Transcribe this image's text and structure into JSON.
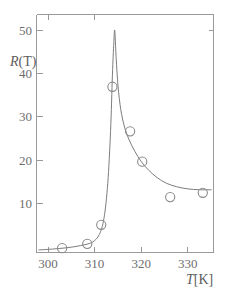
{
  "chart_data": {
    "type": "line",
    "title": "",
    "subtitle": "",
    "xlabel": "T[K]",
    "ylabel": "R(T)",
    "xlim": [
      297.5,
      335.5
    ],
    "ylim": [
      0,
      55
    ],
    "xticks": [
      300,
      310,
      320,
      330
    ],
    "yticks": [
      10,
      20,
      30,
      40,
      50
    ],
    "xtick_labels": [
      "300",
      "310",
      "320",
      "330"
    ],
    "ytick_labels": [
      "10",
      "20",
      "30",
      "40",
      "50"
    ],
    "grid": false,
    "legend": "none",
    "marker": "open-circle",
    "series": [
      {
        "name": "measured",
        "type": "scatter",
        "marker": "open-circle",
        "x": [
          303.0,
          308.4,
          311.4,
          313.8,
          317.6,
          320.2,
          326.2,
          333.2
        ],
        "y": [
          1.0,
          2.0,
          6.4,
          38.3,
          28.0,
          21.0,
          12.8,
          13.8
        ]
      },
      {
        "name": "fit",
        "type": "line",
        "x": [
          298.0,
          301.0,
          304.0,
          307.0,
          309.5,
          311.0,
          312.0,
          312.8,
          313.4,
          313.8,
          314.1,
          314.3,
          314.6,
          315.0,
          315.6,
          316.4,
          317.4,
          318.6,
          320.0,
          321.6,
          323.4,
          325.4,
          327.6,
          330.0,
          332.5,
          335.0
        ],
        "y": [
          0.6,
          0.8,
          1.1,
          1.6,
          2.4,
          4.2,
          8.0,
          16.0,
          28.0,
          41.0,
          48.5,
          51.3,
          45.0,
          38.5,
          33.0,
          29.0,
          26.0,
          23.4,
          21.0,
          19.0,
          17.3,
          16.0,
          15.2,
          14.7,
          14.5,
          14.5
        ]
      }
    ],
    "peak": {
      "x": 314.3,
      "y": 51.3
    },
    "axis_title_x": "T[K]",
    "axis_title_y": "R(T)",
    "colors": {
      "axis": "#9a9a9a",
      "curve": "#7d7d7d",
      "marker": "#8a8a8a",
      "text": "#6e6e6e",
      "background": "#ffffff"
    }
  },
  "labels": {
    "y_axis_title_symbol": "R",
    "y_axis_title_arg": "(T)",
    "x_axis_title_symbol": "T",
    "x_axis_title_unit": "[K]"
  }
}
